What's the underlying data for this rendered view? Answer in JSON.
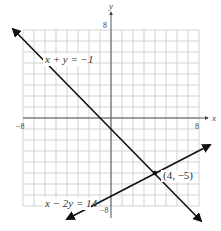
{
  "chart_data": {
    "type": "line",
    "title": "",
    "xlabel": "x",
    "ylabel": "y",
    "xlim": [
      -8,
      8
    ],
    "ylim": [
      -8,
      8
    ],
    "grid": true,
    "grid_step": 1,
    "tick_labels": {
      "x_min": "−8",
      "x_max": "8",
      "y_min": "−8",
      "y_max": "8"
    },
    "series": [
      {
        "name": "x + y = −1",
        "equation": "x + y = -1",
        "points": [
          [
            -9,
            8
          ],
          [
            8,
            -9
          ]
        ],
        "color": "#111111"
      },
      {
        "name": "x − 2y = 14",
        "equation": "x - 2y = 14",
        "points": [
          [
            -4,
            -9
          ],
          [
            9,
            -2.5
          ]
        ],
        "color": "#111111"
      }
    ],
    "annotations": [
      {
        "text": "(4, −5)",
        "x": 4,
        "y": -5,
        "type": "intersection-point"
      }
    ],
    "legend": "none (inline equation labels)"
  },
  "labels": {
    "eq1": "x + y = −1",
    "eq2": "x − 2y = 14",
    "point": "(4, −5)",
    "x_axis": "x",
    "y_axis": "y",
    "x_min": "−8",
    "x_max": "8",
    "y_min": "−8",
    "y_max": "8"
  },
  "colors": {
    "grid": "#c8c8c8",
    "axis": "#555555",
    "line": "#111111"
  }
}
